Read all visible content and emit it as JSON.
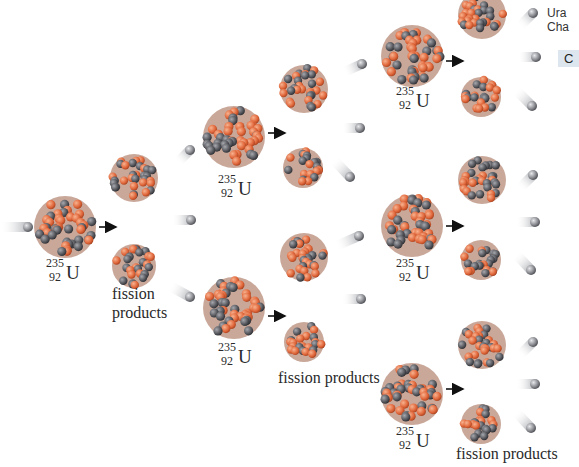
{
  "colors": {
    "proton": "#e0663a",
    "proton_light": "#f2a07a",
    "neutron": "#5b5d63",
    "neutron_light": "#9a9ca2",
    "arrow": "#111111",
    "text": "#2a2a2a",
    "side_button_bg": "#dde6ef"
  },
  "side_panel": {
    "line1": "Ura",
    "line2": "Cha",
    "button_label": "C"
  },
  "isotope": {
    "mass": "235",
    "number": "92",
    "symbol": "U"
  },
  "labels": [
    {
      "id": "fp1",
      "text": "fission",
      "x": 112,
      "y": 284
    },
    {
      "id": "fp1b",
      "text": "products",
      "x": 112,
      "y": 303
    },
    {
      "id": "fp2",
      "text": "fission products",
      "x": 278,
      "y": 368
    },
    {
      "id": "fp3",
      "text": "fission products",
      "x": 456,
      "y": 444
    }
  ],
  "isotope_labels": [
    {
      "x": 46,
      "y": 256
    },
    {
      "x": 218,
      "y": 172
    },
    {
      "x": 218,
      "y": 340
    },
    {
      "x": 396,
      "y": 84
    },
    {
      "x": 396,
      "y": 256
    },
    {
      "x": 396,
      "y": 424
    }
  ],
  "uranium_nuclei": [
    {
      "cx": 65,
      "cy": 227,
      "r": 31
    },
    {
      "cx": 234,
      "cy": 137,
      "r": 31
    },
    {
      "cx": 234,
      "cy": 308,
      "r": 31
    },
    {
      "cx": 412,
      "cy": 56,
      "r": 31
    },
    {
      "cx": 412,
      "cy": 226,
      "r": 31
    },
    {
      "cx": 412,
      "cy": 394,
      "r": 31
    }
  ],
  "fragments": [
    {
      "cx": 134,
      "cy": 178,
      "r": 24
    },
    {
      "cx": 134,
      "cy": 266,
      "r": 22
    },
    {
      "cx": 304,
      "cy": 89,
      "r": 24
    },
    {
      "cx": 303,
      "cy": 168,
      "r": 20
    },
    {
      "cx": 304,
      "cy": 257,
      "r": 24
    },
    {
      "cx": 304,
      "cy": 342,
      "r": 20
    },
    {
      "cx": 482,
      "cy": 15,
      "r": 24
    },
    {
      "cx": 481,
      "cy": 97,
      "r": 20
    },
    {
      "cx": 482,
      "cy": 180,
      "r": 24
    },
    {
      "cx": 481,
      "cy": 260,
      "r": 20
    },
    {
      "cx": 482,
      "cy": 345,
      "r": 24
    },
    {
      "cx": 481,
      "cy": 424,
      "r": 20
    }
  ],
  "neutrons": [
    {
      "x1": 0,
      "y1": 227,
      "x2": 28,
      "y2": 227
    },
    {
      "x1": 172,
      "y1": 220,
      "x2": 191,
      "y2": 220
    },
    {
      "x1": 170,
      "y1": 286,
      "x2": 190,
      "y2": 297
    },
    {
      "x1": 178,
      "y1": 162,
      "x2": 190,
      "y2": 150
    },
    {
      "x1": 342,
      "y1": 128,
      "x2": 360,
      "y2": 128
    },
    {
      "x1": 334,
      "y1": 160,
      "x2": 350,
      "y2": 177
    },
    {
      "x1": 344,
      "y1": 72,
      "x2": 362,
      "y2": 64
    },
    {
      "x1": 342,
      "y1": 299,
      "x2": 361,
      "y2": 299
    },
    {
      "x1": 336,
      "y1": 246,
      "x2": 359,
      "y2": 236
    },
    {
      "x1": 520,
      "y1": 26,
      "x2": 533,
      "y2": 13
    },
    {
      "x1": 518,
      "y1": 57,
      "x2": 536,
      "y2": 57
    },
    {
      "x1": 516,
      "y1": 90,
      "x2": 532,
      "y2": 106
    },
    {
      "x1": 520,
      "y1": 188,
      "x2": 533,
      "y2": 175
    },
    {
      "x1": 516,
      "y1": 222,
      "x2": 535,
      "y2": 222
    },
    {
      "x1": 516,
      "y1": 254,
      "x2": 531,
      "y2": 270
    },
    {
      "x1": 520,
      "y1": 355,
      "x2": 533,
      "y2": 342
    },
    {
      "x1": 516,
      "y1": 384,
      "x2": 535,
      "y2": 384
    },
    {
      "x1": 516,
      "y1": 412,
      "x2": 531,
      "y2": 428
    }
  ],
  "arrows": [
    {
      "x1": 99,
      "y1": 227,
      "x2": 116,
      "y2": 227
    },
    {
      "x1": 268,
      "y1": 133,
      "x2": 285,
      "y2": 133
    },
    {
      "x1": 268,
      "y1": 316,
      "x2": 285,
      "y2": 316
    },
    {
      "x1": 446,
      "y1": 61,
      "x2": 463,
      "y2": 61
    },
    {
      "x1": 446,
      "y1": 226,
      "x2": 463,
      "y2": 226
    },
    {
      "x1": 446,
      "y1": 389,
      "x2": 463,
      "y2": 389
    }
  ]
}
